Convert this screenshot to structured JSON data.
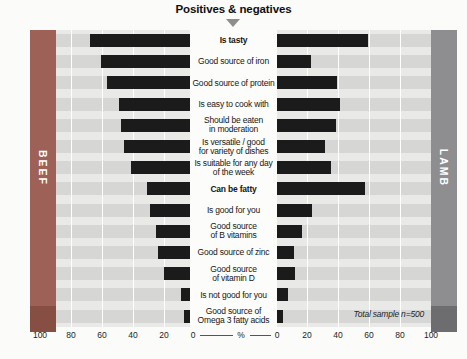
{
  "header": {
    "title": "Positives & negatives"
  },
  "bands": {
    "left": "BEEF",
    "right": "LAMB"
  },
  "axis": {
    "left_ticks": [
      "100",
      "80",
      "60",
      "40",
      "20"
    ],
    "zero_left": "0",
    "percent": "%",
    "zero_right": "0",
    "right_ticks": [
      "20",
      "40",
      "60",
      "80",
      "100"
    ]
  },
  "footnote": "Total sample n=500",
  "colors": {
    "beef_band": "#9d6157",
    "beef_corner": "#874f44",
    "lamb_band": "#8e8e90",
    "lamb_corner": "#6d6d6f",
    "bar": "#1b1b1b",
    "stripe_dark": "#d6d6d4",
    "stripe_light": "#e9e9e7",
    "pointer": "#8e8e8e"
  },
  "chart_data": {
    "type": "bar",
    "subtype": "diverging-butterfly",
    "title": "Positives & negatives",
    "xlabel": "%",
    "xlim": [
      0,
      100
    ],
    "axis_ticks": [
      0,
      20,
      40,
      60,
      80,
      100
    ],
    "grid": true,
    "sample_note": "Total sample n=500",
    "categories": [
      "Is tasty",
      "Good source of iron",
      "Good source of protein",
      "Is easy to cook with",
      "Should be eaten\nin moderation",
      "Is versatile / good\nfor variety of dishes",
      "Is suitable for any day\nof the week",
      "Can be fatty",
      "Is good for you",
      "Good source\nof B vitamins",
      "Good source of zinc",
      "Good source\nof vitamin D",
      "Is not good for you",
      "Good source of\nOmega 3 fatty acids"
    ],
    "bold_category_indexes": [
      0,
      7
    ],
    "series": [
      {
        "name": "BEEF",
        "side": "left",
        "values": [
          65,
          58,
          54,
          46,
          45,
          43,
          38,
          28,
          26,
          22,
          21,
          17,
          6,
          4
        ]
      },
      {
        "name": "LAMB",
        "side": "right",
        "values": [
          59,
          22,
          39,
          41,
          38,
          31,
          35,
          57,
          23,
          16,
          11,
          12,
          7,
          4
        ]
      }
    ]
  }
}
